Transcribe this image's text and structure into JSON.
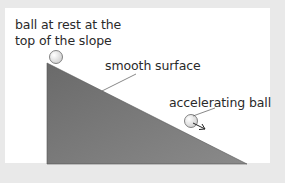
{
  "diagram": {
    "labels": {
      "top_ball_line1": "ball at rest at the",
      "top_ball_line2": "top of the slope",
      "surface": "smooth surface",
      "moving_ball": "accelerating ball"
    },
    "colors": {
      "background": "#e9e9e9",
      "panel": "#ffffff",
      "slope_fill_dark": "#6e6e6e",
      "slope_fill_light": "#9a9a9a",
      "ball_fill": "#eeeeee",
      "leader_line": "#555555"
    }
  }
}
